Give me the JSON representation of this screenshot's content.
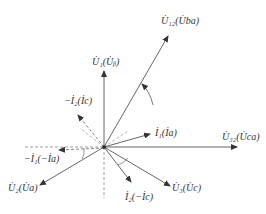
{
  "diagram": {
    "title": "",
    "origin": [
      104,
      147
    ],
    "vectors": [
      {
        "id": "U1",
        "label": "U̇1(U̇b)",
        "end": [
          104,
          70
        ],
        "style": "solid"
      },
      {
        "id": "U12",
        "label": "U̇12(U̇ba)",
        "end": [
          168,
          35
        ],
        "style": "solid"
      },
      {
        "id": "U32",
        "label": "U̇32(U̇ca)",
        "end": [
          238,
          147
        ],
        "style": "solid"
      },
      {
        "id": "I1",
        "label": "İ1(İa)",
        "end": [
          150,
          133
        ],
        "style": "solid"
      },
      {
        "id": "U3",
        "label": "U̇3(U̇c)",
        "end": [
          171,
          187
        ],
        "style": "solid"
      },
      {
        "id": "I2",
        "label": "İ2(−İc)",
        "end": [
          131,
          183
        ],
        "style": "solid"
      },
      {
        "id": "U2",
        "label": "U̇2(U̇a)",
        "end": [
          39,
          186
        ],
        "style": "solid"
      },
      {
        "id": "mI1",
        "label": "−İ1(−İa)",
        "end": [
          58,
          150
        ],
        "style": "dashed"
      },
      {
        "id": "mI2",
        "label": "−İ2(İc)",
        "end": [
          77,
          114
        ],
        "style": "dashed"
      }
    ],
    "labels": {
      "U1": "U̇₁(U̇ᵦ)",
      "U12": "U̇₁₂(U̇ba)",
      "U32": "U̇₃₂(U̇ca)",
      "I1": "İ₁(İa)",
      "U3": "U̇₃(U̇c)",
      "I2": "İ₂(−İc)",
      "U2": "U̇₂(U̇a)",
      "mI1": "−İ₁(−İa)",
      "mI2": "−İ₂(İc)"
    },
    "rotation_arrow": "counterclockwise",
    "colors": {
      "line": "#555555",
      "text": "#333333"
    }
  }
}
